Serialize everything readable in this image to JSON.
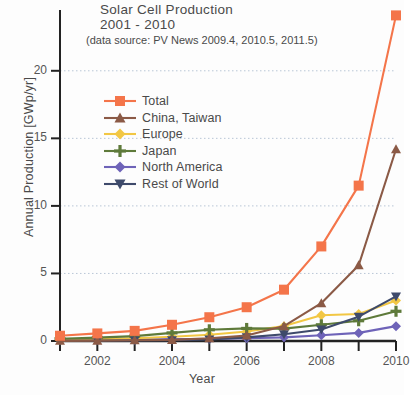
{
  "chart_data": {
    "type": "line",
    "title": "Solar Cell Production",
    "subtitle": "2001 - 2010",
    "annotation": "(data source: PV News 2009.4, 2010.5, 2011.5)",
    "xlabel": "Year",
    "ylabel": "Annual Production [GWp/yr]",
    "xlim": [
      2001,
      2010
    ],
    "ylim": [
      0,
      24.5
    ],
    "xticks": [
      2001,
      2002,
      2003,
      2004,
      2005,
      2006,
      2007,
      2008,
      2009,
      2010
    ],
    "xtick_labels": [
      "",
      "2002",
      "",
      "2004",
      "",
      "2006",
      "",
      "2008",
      "",
      "2010"
    ],
    "yticks": [
      0,
      5,
      10,
      15,
      20
    ],
    "ytick_labels": [
      "0",
      "5",
      "10",
      "15",
      "20"
    ],
    "grid": true,
    "legend_position": "upper left",
    "x": [
      2001,
      2002,
      2003,
      2004,
      2005,
      2006,
      2007,
      2008,
      2009,
      2010
    ],
    "series": [
      {
        "name": "Total",
        "color": "#F4754A",
        "marker": "square",
        "values": [
          0.39,
          0.56,
          0.75,
          1.2,
          1.76,
          2.5,
          3.8,
          7.0,
          11.5,
          24.1
        ]
      },
      {
        "name": "China, Taiwan",
        "color": "#8B5A46",
        "marker": "triangle-up",
        "values": [
          0.01,
          0.02,
          0.05,
          0.08,
          0.2,
          0.4,
          1.1,
          2.8,
          5.6,
          14.2
        ]
      },
      {
        "name": "Europe",
        "color": "#F2C744",
        "marker": "diamond",
        "values": [
          0.09,
          0.14,
          0.2,
          0.32,
          0.47,
          0.7,
          1.1,
          1.9,
          2.0,
          3.0
        ]
      },
      {
        "name": "Japan",
        "color": "#5E7A3A",
        "marker": "plus",
        "values": [
          0.17,
          0.25,
          0.36,
          0.6,
          0.83,
          0.93,
          0.92,
          1.2,
          1.5,
          2.2
        ]
      },
      {
        "name": "North America",
        "color": "#6E63B8",
        "marker": "diamond",
        "values": [
          0.1,
          0.12,
          0.1,
          0.14,
          0.15,
          0.2,
          0.27,
          0.42,
          0.6,
          1.1
        ]
      },
      {
        "name": "Rest of World",
        "color": "#3E4A6B",
        "marker": "triangle-down",
        "values": [
          0.02,
          0.03,
          0.04,
          0.06,
          0.11,
          0.27,
          0.5,
          0.85,
          1.8,
          3.3
        ]
      }
    ]
  },
  "legend": {
    "items": [
      {
        "label": "Total"
      },
      {
        "label": "China, Taiwan"
      },
      {
        "label": "Europe"
      },
      {
        "label": "Japan"
      },
      {
        "label": "North America"
      },
      {
        "label": "Rest of World"
      }
    ]
  }
}
